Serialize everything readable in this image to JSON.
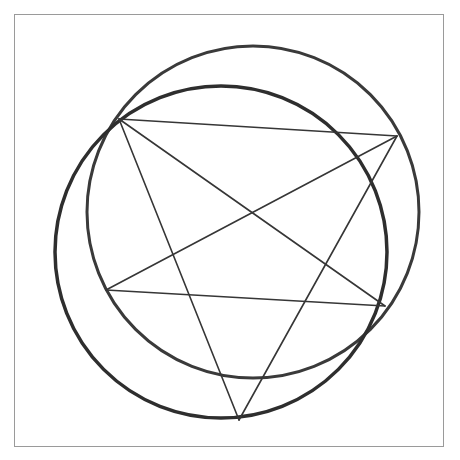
{
  "figure": {
    "frame": {
      "x": 14,
      "y": 14,
      "width": 430,
      "height": 433,
      "stroke": "#9a9a9a"
    },
    "circles": [
      {
        "name": "upper-right-circle",
        "cx": 253,
        "cy": 212,
        "r": 166,
        "stroke": "#3a3a3a",
        "stroke_width": 3
      },
      {
        "name": "lower-left-circle",
        "cx": 221,
        "cy": 252,
        "r": 166,
        "stroke": "#2e2e2e",
        "stroke_width": 3.5
      }
    ],
    "star_vertices": [
      {
        "name": "top-left",
        "x": 119,
        "y": 119
      },
      {
        "name": "right",
        "x": 397,
        "y": 136
      },
      {
        "name": "lower-right",
        "x": 385,
        "y": 306
      },
      {
        "name": "bottom",
        "x": 239,
        "y": 420
      },
      {
        "name": "left",
        "x": 106,
        "y": 290
      }
    ],
    "star_edges": [
      [
        0,
        1
      ],
      [
        0,
        2
      ],
      [
        0,
        3
      ],
      [
        1,
        3
      ],
      [
        1,
        4
      ],
      [
        4,
        2
      ]
    ],
    "star_stroke": "#363636",
    "star_stroke_width": 1.6
  },
  "caption": {
    "text": ""
  }
}
